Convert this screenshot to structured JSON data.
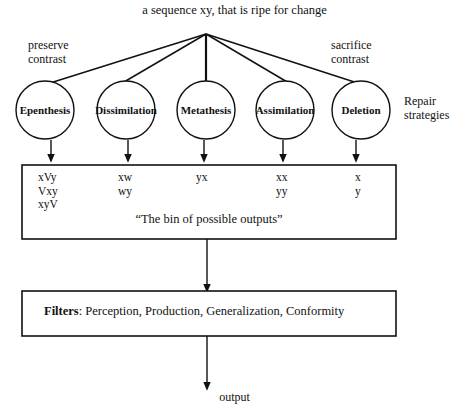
{
  "diagram": {
    "title": "a sequence xy, that is ripe for change",
    "left_annotation": "preserve\ncontrast",
    "left_annotation_line1": "preserve",
    "left_annotation_line2": "contrast",
    "right_annotation_line1": "sacrifice",
    "right_annotation_line2": "contrast",
    "side_label_line1": "Repair",
    "side_label_line2": "strategies",
    "stroke_color": "#111111",
    "background_color": "#ffffff"
  },
  "repair_strategies": [
    {
      "label": "Epenthesis",
      "cx": 45,
      "cy": 110,
      "r": 29
    },
    {
      "label": "Dissimilation",
      "cx": 126,
      "cy": 110,
      "r": 29
    },
    {
      "label": "Metathesis",
      "cx": 206,
      "cy": 110,
      "r": 29
    },
    {
      "label": "Assimilation",
      "cx": 285,
      "cy": 110,
      "r": 29
    },
    {
      "label": "Deletion",
      "cx": 361,
      "cy": 110,
      "r": 29
    }
  ],
  "bin": {
    "caption": "“The bin of possible outputs”",
    "columns": [
      {
        "outputs": [
          "xVy",
          "Vxy",
          "xyV"
        ],
        "x": 38
      },
      {
        "outputs": [
          "xw",
          "wy"
        ],
        "x": 118
      },
      {
        "outputs": [
          "yx"
        ],
        "x": 196
      },
      {
        "outputs": [
          "xx",
          "yy"
        ],
        "x": 276
      },
      {
        "outputs": [
          "x",
          "y"
        ],
        "x": 355
      }
    ]
  },
  "filters": {
    "heading": "Filters",
    "separator": ": ",
    "items_text": "Perception, Production, Generalization, Conformity",
    "items": [
      "Perception",
      "Production",
      "Generalization",
      "Conformity"
    ]
  },
  "output": {
    "label": "output"
  }
}
